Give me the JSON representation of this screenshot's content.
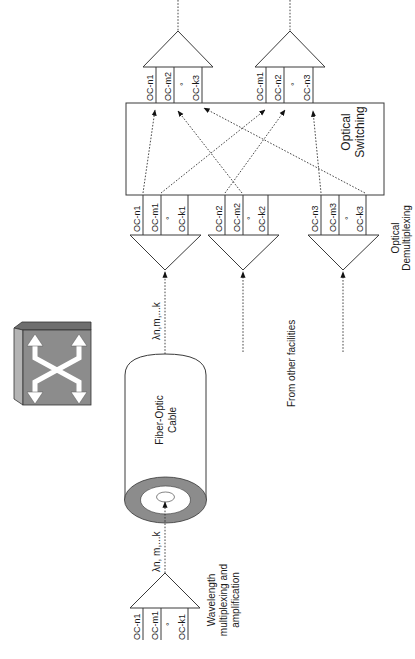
{
  "diagram": {
    "orientation": "rotated-90-ccw",
    "switch_icon": {
      "icon": "optical-switch-icon"
    },
    "fiber_cable": {
      "label_line1": "Fiber-Optic",
      "label_line2": "Cable"
    },
    "wavelength_bottom": "λn, m,...k",
    "wavelength_top": "λn,m,...k",
    "mux": {
      "channels": [
        "OC-n1",
        "OC-m1",
        "°",
        "OC-k1"
      ],
      "caption_line1": "Wavelength",
      "caption_line2": "multiplexing and",
      "caption_line3": "amplification"
    },
    "other_facilities": "From other facilities",
    "demux": {
      "caption_line1": "Optical",
      "caption_line2": "Demultiplexing",
      "groups": [
        [
          "OC-n1",
          "OC-m1",
          "°",
          "OC-k1"
        ],
        [
          "OC-n2",
          "OC-m2",
          "°",
          "OC-k2"
        ],
        [
          "OC-n3",
          "OC-m3",
          "°",
          "OC-k3"
        ]
      ]
    },
    "switching": {
      "label_line1": "Optical",
      "label_line2": "Switching"
    },
    "outputs": {
      "groups": [
        [
          "OC-n1",
          "OC-m2",
          "°",
          "OC-k3"
        ],
        [
          "OC-m1",
          "OC-n2",
          "°",
          "OC-n3"
        ]
      ]
    },
    "connections": [
      {
        "from": "OC-n1",
        "to": "OC-n1"
      },
      {
        "from": "OC-m1",
        "to": "OC-m1"
      },
      {
        "from": "OC-n2",
        "to": "OC-n2"
      },
      {
        "from": "OC-m2",
        "to": "OC-m2"
      },
      {
        "from": "OC-n3",
        "to": "OC-n3"
      },
      {
        "from": "OC-k3",
        "to": "OC-k3"
      }
    ],
    "colors": {
      "line": "#3a3a3a",
      "switch_face": "#8c8c8c",
      "switch_top": "#6e6e6e",
      "switch_side": "#b4b4b4",
      "cable_ring": "#8c8c8c"
    }
  }
}
